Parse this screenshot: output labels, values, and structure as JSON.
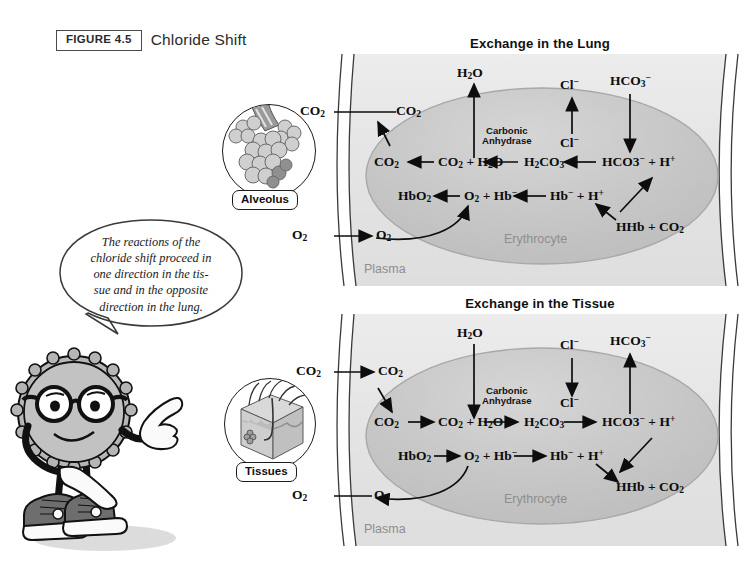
{
  "figure": {
    "badge": "FIGURE 4.5",
    "title": "Chloride Shift"
  },
  "callout": {
    "text": "The reactions of the chloride shift proceed in one direction in the tis-sue and in the opposite direction in the lung.",
    "line1": "The reactions of the",
    "line2": "chloride shift proceed in",
    "line3": "one direction in the tis-",
    "line4": "sue and in the opposite",
    "line5": "direction in the lung."
  },
  "insets": [
    {
      "name": "alveolus",
      "label": "Alveolus"
    },
    {
      "name": "tissues",
      "label": "Tissues"
    }
  ],
  "panels": [
    {
      "id": "lung",
      "title": "Exchange in the Lung",
      "plasma_label": "Plasma",
      "cell_label": "Erythrocyte",
      "enzyme_label_line1": "Carbonic",
      "enzyme_label_line2": "Anhydrase",
      "external": {
        "co2_out": "CO2",
        "o2_in": "O2"
      },
      "plasma_species": {
        "co2": "CO2",
        "o2": "O2",
        "h2o_out": "H2O",
        "cl_out": "Cl−",
        "hco3_in": "HCO3−"
      },
      "membrane_species": {
        "cl_in": "Cl−"
      },
      "reaction_top": [
        "CO2",
        "CO2 + H2O",
        "H2CO3",
        "HCO3− + H+"
      ],
      "reaction_mid": [
        "HbO2",
        "O2 + Hb−",
        "Hb− + H+"
      ],
      "reaction_hhb": "HHb + CO2",
      "direction": "right-to-left"
    },
    {
      "id": "tissue",
      "title": "Exchange in the Tissue",
      "plasma_label": "Plasma",
      "cell_label": "Erythrocyte",
      "enzyme_label_line1": "Carbonic",
      "enzyme_label_line2": "Anhydrase",
      "external": {
        "co2_in": "CO2",
        "o2_out": "O2"
      },
      "plasma_species": {
        "co2": "CO2",
        "o2": "O2",
        "h2o_in": "H2O",
        "cl_in": "Cl−",
        "hco3_out": "HCO3−"
      },
      "membrane_species": {
        "cl_out": "Cl−"
      },
      "reaction_top": [
        "CO2",
        "CO2 + H2O",
        "H2CO3",
        "HCO3− + H+"
      ],
      "reaction_mid": [
        "HbO2",
        "O2 + Hb−",
        "Hb− + H+"
      ],
      "reaction_hhb": "HHb + CO2",
      "direction": "left-to-right"
    }
  ],
  "colors": {
    "plasma": "#e4e4e4",
    "erythrocyte": "#c9c9c9",
    "wall_line": "#3a3a3a",
    "text": "#111111",
    "faint_text": "#8e8e8e",
    "mascot_body": "#b5b5b5",
    "mascot_shoe": "#6e6e6e"
  }
}
